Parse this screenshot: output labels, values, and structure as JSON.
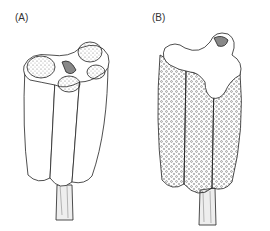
{
  "figure": {
    "panels": [
      {
        "label": "(A)",
        "description": "anther cross-section showing four pollen sacs, closed"
      },
      {
        "label": "(B)",
        "description": "dehisced anther with open locules releasing pollen"
      }
    ]
  }
}
